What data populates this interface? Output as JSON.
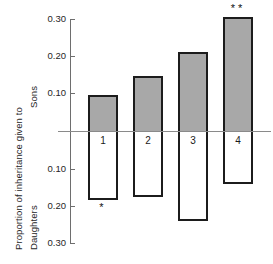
{
  "chart_data": {
    "type": "bar",
    "title": "",
    "subtitle": "",
    "ylabel_main": "Proportion of inheritance given to",
    "ylabel_top": "Sons",
    "ylabel_bottom": "Daughters",
    "xlabel": "",
    "categories": [
      "1",
      "2",
      "3",
      "4"
    ],
    "orientation": "vertical-diverging",
    "grid": false,
    "legend": "none",
    "axis": {
      "ticks_above_zero": [
        "0.10",
        "0.20",
        "0.30"
      ],
      "ticks_below_zero": [
        "0.10",
        "0.20",
        "0.30"
      ],
      "tick_labels_top_to_bottom": [
        "0.30",
        "0.20",
        "0.10",
        "0.10",
        "0.20",
        "0.30"
      ],
      "ylim_sons": [
        0,
        0.3
      ],
      "ylim_daughters": [
        0,
        0.3
      ],
      "zero_label": ""
    },
    "series": [
      {
        "name": "Sons",
        "values": [
          0.095,
          0.148,
          0.21,
          0.305
        ]
      },
      {
        "name": "Daughters",
        "values": [
          0.185,
          0.175,
          0.24,
          0.14
        ]
      }
    ],
    "annotations": [
      {
        "category": "1",
        "text": "*",
        "position": "below"
      },
      {
        "category": "4",
        "text": "**",
        "position": "above"
      }
    ],
    "colors": {
      "sons_fill": "#a8a8a8",
      "daughters_fill": "#ffffff",
      "bar_outline": "#1c1c1c",
      "axis": "#6e6e6e",
      "zero_line": "#8a8a8a",
      "text": "#262626",
      "background": "#ffffff"
    }
  }
}
